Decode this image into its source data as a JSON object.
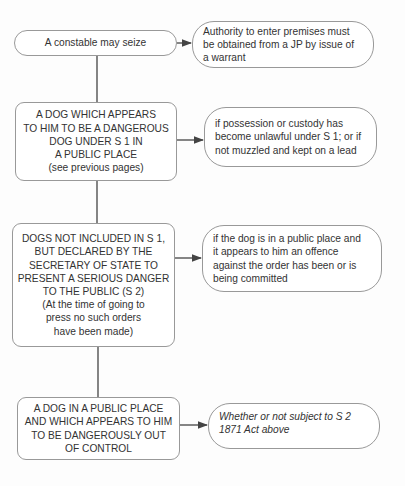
{
  "diagram": {
    "nodes": [
      {
        "id": "n1",
        "text": "A constable may seize"
      },
      {
        "id": "n2",
        "text": "A DOG WHICH APPEARS\nTO HIM TO BE A DANGEROUS\nDOG UNDER S 1 IN\nA PUBLIC PLACE\n(see previous pages)"
      },
      {
        "id": "n3",
        "text": "DOGS NOT INCLUDED IN S 1,\nBUT DECLARED BY THE\nSECRETARY OF STATE TO\nPRESENT A SERIOUS DANGER\nTO THE PUBLIC (S 2)\n(At the time of going to\npress no such orders\nhave been made)"
      },
      {
        "id": "n4",
        "text": "A DOG IN A PUBLIC PLACE\nAND WHICH APPEARS TO HIM\nTO BE DANGEROUSLY OUT\nOF CONTROL"
      }
    ],
    "notes": [
      {
        "id": "r1",
        "text": "Authority to enter premises must\nbe obtained from a JP by issue of\na warrant"
      },
      {
        "id": "r2",
        "text": "if possession or custody has\nbecome unlawful under S 1; or if\nnot muzzled and kept on a lead"
      },
      {
        "id": "r3",
        "text": "if the dog is in a public place and\nit appears to him an offence\nagainst the order has been or is\nbeing committed"
      },
      {
        "id": "r4",
        "text": "Whether or not subject to S 2\n1871 Act above"
      }
    ],
    "colors": {
      "line": "#444444",
      "border": "#999999",
      "text": "#333333"
    }
  }
}
